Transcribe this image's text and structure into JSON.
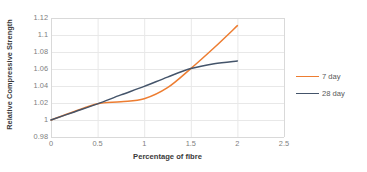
{
  "chart_data": {
    "type": "line",
    "title": "",
    "xlabel": "Percentage of fibre",
    "ylabel": "Relative Compressive Strength",
    "xlim": [
      0,
      2.5
    ],
    "ylim": [
      0.98,
      1.12
    ],
    "xticks": [
      "0",
      "0.5",
      "1",
      "1.5",
      "2",
      "2.5"
    ],
    "xtick_values": [
      0,
      0.5,
      1,
      1.5,
      2,
      2.5
    ],
    "yticks": [
      "0.98",
      "1",
      "1.02",
      "1.04",
      "1.06",
      "1.08",
      "1.1",
      "1.12"
    ],
    "ytick_values": [
      0.98,
      1.0,
      1.02,
      1.04,
      1.06,
      1.08,
      1.1,
      1.12
    ],
    "grid": true,
    "grid_color": "#e8e8e8",
    "legend_position": "right",
    "series": [
      {
        "name": "7 day",
        "color": "#ed7d31",
        "x": [
          0,
          0.25,
          0.5,
          0.75,
          1.0,
          1.25,
          1.5,
          1.75,
          2.0
        ],
        "values": [
          1.0,
          1.01,
          1.019,
          1.0215,
          1.025,
          1.038,
          1.0605,
          1.085,
          1.111
        ]
      },
      {
        "name": "28 day",
        "color": "#44546a",
        "x": [
          0,
          0.25,
          0.5,
          0.75,
          1.0,
          1.25,
          1.5,
          1.75,
          2.0
        ],
        "values": [
          1.0,
          1.0095,
          1.019,
          1.0295,
          1.0395,
          1.0505,
          1.0605,
          1.0663,
          1.0695
        ]
      }
    ]
  },
  "legend": {
    "items": [
      {
        "label": "7 day",
        "color": "#ed7d31"
      },
      {
        "label": "28 day",
        "color": "#44546a"
      }
    ]
  }
}
